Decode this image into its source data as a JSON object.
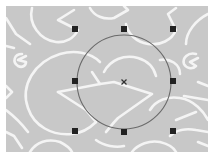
{
  "canvas": {
    "background_color": "#ffffff",
    "artwork_color": "#c8c8c8",
    "pattern_color": "#f4f4f4",
    "artwork_bounds": {
      "x": 6,
      "y": 6,
      "width": 202,
      "height": 146
    }
  },
  "selection": {
    "shape": "ellipse",
    "center": {
      "x": 124,
      "y": 82
    },
    "radius": 47,
    "stroke_color": "#6a6a6a",
    "handle_color": "#222222",
    "handle_size": 6,
    "bounding_box": {
      "left": 75,
      "top": 29,
      "right": 173,
      "bottom": 131
    },
    "handles": [
      {
        "name": "top-left",
        "x": 75,
        "y": 29
      },
      {
        "name": "top-center",
        "x": 124,
        "y": 29
      },
      {
        "name": "top-right",
        "x": 173,
        "y": 29
      },
      {
        "name": "middle-left",
        "x": 75,
        "y": 81
      },
      {
        "name": "middle-right",
        "x": 173,
        "y": 81
      },
      {
        "name": "bottom-left",
        "x": 75,
        "y": 131
      },
      {
        "name": "bottom-center",
        "x": 124,
        "y": 132
      },
      {
        "name": "bottom-right",
        "x": 173,
        "y": 131
      }
    ],
    "center_marker": "x-mark"
  }
}
